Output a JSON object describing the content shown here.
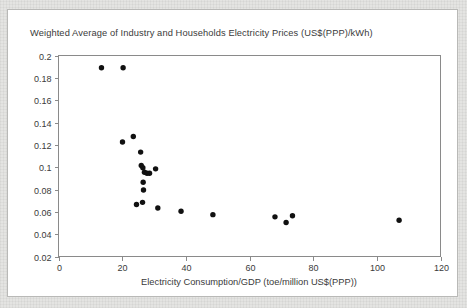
{
  "chart_data": {
    "type": "scatter",
    "title": "Weighted Average of Industry and Households Electricity Prices (US$(PPP)/kWh)",
    "xlabel": "Electricity Consumption/GDP (toe/million US$(PPP))",
    "ylabel": "",
    "xlim": [
      0,
      120
    ],
    "ylim": [
      0.02,
      0.2
    ],
    "grid": false,
    "legend": false,
    "xticks": [
      0,
      20,
      40,
      60,
      80,
      100,
      120
    ],
    "xtick_labels": [
      "0",
      "20",
      "40",
      "60",
      "80",
      "100",
      "120"
    ],
    "yticks": [
      0.02,
      0.04,
      0.06,
      0.08,
      0.1,
      0.12,
      0.14,
      0.16,
      0.18,
      0.2
    ],
    "ytick_labels": [
      "0.02",
      "0.04",
      "0.06",
      "0.08",
      "0.1",
      "0.12",
      "0.14",
      "0.16",
      "0.18",
      "0.2"
    ],
    "marker": "circle",
    "marker_color": "#111111",
    "points": [
      {
        "x": 13.5,
        "y": 0.189
      },
      {
        "x": 20.3,
        "y": 0.189
      },
      {
        "x": 20.1,
        "y": 0.1225
      },
      {
        "x": 23.5,
        "y": 0.1275
      },
      {
        "x": 25.8,
        "y": 0.1135
      },
      {
        "x": 26.0,
        "y": 0.1015
      },
      {
        "x": 26.5,
        "y": 0.0995
      },
      {
        "x": 27.0,
        "y": 0.0955
      },
      {
        "x": 27.8,
        "y": 0.0945
      },
      {
        "x": 28.6,
        "y": 0.0945
      },
      {
        "x": 30.5,
        "y": 0.0985
      },
      {
        "x": 26.6,
        "y": 0.0865
      },
      {
        "x": 26.7,
        "y": 0.0795
      },
      {
        "x": 24.5,
        "y": 0.0665
      },
      {
        "x": 26.4,
        "y": 0.0685
      },
      {
        "x": 31.2,
        "y": 0.0635
      },
      {
        "x": 38.5,
        "y": 0.0605
      },
      {
        "x": 48.5,
        "y": 0.0575
      },
      {
        "x": 68.0,
        "y": 0.0555
      },
      {
        "x": 73.5,
        "y": 0.0565
      },
      {
        "x": 71.5,
        "y": 0.0505
      },
      {
        "x": 107.0,
        "y": 0.0525
      }
    ]
  },
  "axes": {
    "x_tick_labels": [
      "0",
      "20",
      "40",
      "60",
      "80",
      "100",
      "120"
    ],
    "y_tick_labels": [
      "0.02",
      "0.04",
      "0.06",
      "0.08",
      "0.1",
      "0.12",
      "0.14",
      "0.16",
      "0.18",
      "0.2"
    ]
  }
}
